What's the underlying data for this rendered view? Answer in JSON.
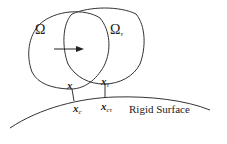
{
  "diagram": {
    "labels": {
      "omega": "Ω",
      "omega_tau_base": "Ω",
      "omega_tau_sub": "τ",
      "x": "x",
      "x_tau_base": "x",
      "x_tau_sub": "τ",
      "x_c_base": "x",
      "x_c_sub": "c",
      "x_ctau_base": "x",
      "x_ctau_sub": "cτ",
      "rigid_surface": "Rigid Surface"
    },
    "colors": {
      "stroke": "#333333",
      "text": "#222222"
    }
  }
}
